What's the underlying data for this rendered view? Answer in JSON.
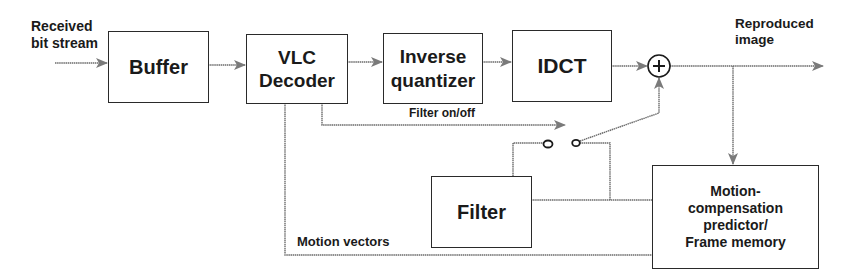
{
  "diagram": {
    "title": "",
    "blocks": {
      "buffer": "Buffer",
      "vlc_decoder": "VLC\nDecoder",
      "inverse_quantizer": "Inverse\nquantizer",
      "idct": "IDCT",
      "filter": "Filter",
      "motion_compensation": "Motion-\ncompensation\npredictor/\nFrame memory"
    },
    "summing_junction": "+",
    "labels": {
      "input": "Received\nbit stream",
      "output": "Reproduced\nimage",
      "filter_control": "Filter on/off",
      "motion_vectors": "Motion vectors"
    },
    "colors": {
      "line": "#6b6b6b",
      "border": "#2a2a2a",
      "text": "#1a1a1a",
      "arrowhead": "#7a7a7a"
    }
  }
}
